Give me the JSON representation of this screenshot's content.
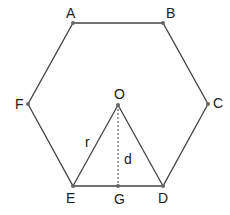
{
  "diagram": {
    "vertices": {
      "A": {
        "label": "A",
        "x": 73,
        "y": 23
      },
      "B": {
        "label": "B",
        "x": 163,
        "y": 23
      },
      "C": {
        "label": "C",
        "x": 208,
        "y": 104
      },
      "D": {
        "label": "D",
        "x": 163,
        "y": 186
      },
      "E": {
        "label": "E",
        "x": 73,
        "y": 186
      },
      "F": {
        "label": "F",
        "x": 28,
        "y": 104
      },
      "O": {
        "label": "O",
        "x": 118,
        "y": 105
      },
      "G": {
        "label": "G",
        "x": 118,
        "y": 186
      }
    },
    "segment_labels": {
      "r": "r",
      "d": "d"
    },
    "colors": {
      "line": "#444444",
      "point": "#666666",
      "text": "#222222"
    }
  }
}
